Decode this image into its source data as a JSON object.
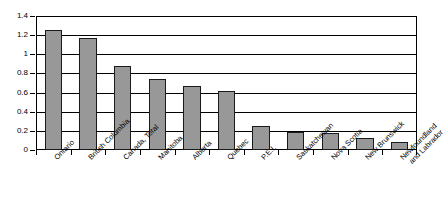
{
  "chart_data": {
    "type": "bar",
    "title": "",
    "subtitle": "",
    "xlabel": "",
    "ylabel": "",
    "ylim": [
      0,
      1.4
    ],
    "grid": true,
    "legend": false,
    "legend_position": "none",
    "bar_color": "#989898",
    "bar_border_color": "#1a1a1a",
    "axis_color": "#000000",
    "background": "#ffffff",
    "y_ticks": [
      "0",
      "0.2",
      "0.4",
      "0.6",
      "0.8",
      "1",
      "1.2",
      "1.4"
    ],
    "y_tick_values": [
      0,
      0.2,
      0.4,
      0.6,
      0.8,
      1.0,
      1.2,
      1.4
    ],
    "categories": [
      "Ontario",
      "British Columbia",
      "Canada, Total",
      "Manitoba",
      "Alberta",
      "Quebec",
      "P.E.I.",
      "Saskatchewan",
      "Nova Scotia",
      "New Brunswick",
      "Newfoundland and Labrador"
    ],
    "category_lines": [
      [
        "Ontario"
      ],
      [
        "British Columbia"
      ],
      [
        "Canada, Total"
      ],
      [
        "Manitoba"
      ],
      [
        "Alberta"
      ],
      [
        "Quebec"
      ],
      [
        "P.E.I."
      ],
      [
        "Saskatchewan"
      ],
      [
        "Nova Scotia"
      ],
      [
        "New Brunswick"
      ],
      [
        "Newfoundland",
        "and Labrador"
      ]
    ],
    "values": [
      1.25,
      1.17,
      0.88,
      0.74,
      0.67,
      0.62,
      0.25,
      0.19,
      0.18,
      0.13,
      0.08
    ]
  }
}
